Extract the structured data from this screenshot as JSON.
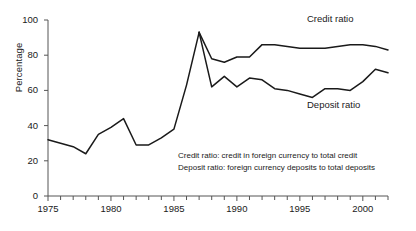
{
  "chart_data": {
    "type": "line",
    "title": "",
    "xlabel": "",
    "ylabel": "Percentage",
    "xlim": [
      1975,
      2002
    ],
    "ylim": [
      0,
      100
    ],
    "yticks": [
      0,
      20,
      40,
      60,
      80,
      100
    ],
    "xticks_major": [
      1975,
      1980,
      1985,
      1990,
      1995,
      2000
    ],
    "xticks_minor_step": 1,
    "grid": false,
    "legend_position": "inline-annotation",
    "series": [
      {
        "name": "Combined ratio (pre-split)",
        "x": [
          1975,
          1976,
          1977,
          1978,
          1979,
          1980,
          1981,
          1982,
          1983,
          1984,
          1985,
          1986,
          1987
        ],
        "values": [
          32,
          30,
          28,
          24,
          35,
          39,
          44,
          29,
          29,
          33,
          38,
          63,
          93
        ]
      },
      {
        "name": "Credit ratio",
        "x": [
          1987,
          1988,
          1989,
          1990,
          1991,
          1992,
          1993,
          1994,
          1995,
          1996,
          1997,
          1998,
          1999,
          2000,
          2001,
          2002
        ],
        "values": [
          93,
          78,
          76,
          79,
          79,
          86,
          86,
          85,
          84,
          84,
          84,
          85,
          86,
          86,
          85,
          83
        ]
      },
      {
        "name": "Deposit ratio",
        "x": [
          1987,
          1988,
          1989,
          1990,
          1991,
          1992,
          1993,
          1994,
          1995,
          1996,
          1997,
          1998,
          1999,
          2000,
          2001,
          2002
        ],
        "values": [
          93,
          62,
          68,
          62,
          67,
          66,
          61,
          60,
          58,
          56,
          61,
          61,
          60,
          65,
          72,
          70
        ]
      }
    ]
  },
  "annotations": {
    "credit_label": "Credit ratio",
    "deposit_label": "Deposit ratio",
    "note_line1": "Credit ratio: credit in foreign currency to total credit",
    "note_line2": "Deposit ratio: foreign currency deposits to total deposits"
  },
  "axis": {
    "ylabel": "Percentage",
    "ytick_labels": [
      "0",
      "20",
      "40",
      "60",
      "80",
      "100"
    ],
    "xtick_labels": [
      "1975",
      "1980",
      "1985",
      "1990",
      "1995",
      "2000"
    ]
  },
  "colors": {
    "line": "#1a1a1a",
    "axis": "#555555",
    "text": "#1a1a1a",
    "background": "#ffffff"
  }
}
